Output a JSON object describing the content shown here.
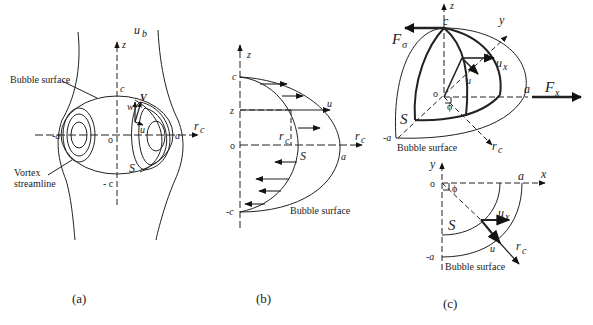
{
  "panels": {
    "a": {
      "caption": "(a)",
      "labels": {
        "u_b": "u",
        "u_b_sub": "b",
        "z": "z",
        "c": "c",
        "neg_c": "- c",
        "o": "o",
        "a_right": "a",
        "a_left": "-a",
        "r_c": "r",
        "r_c_sub": "c",
        "V": "V",
        "w": "w",
        "u": "u",
        "S": "S",
        "bubble_surface": "Bubble surface",
        "vortex_line1": "Vortex",
        "vortex_line2": "streamline"
      }
    },
    "b": {
      "caption": "(b)",
      "labels": {
        "z_axis": "z",
        "c": "c",
        "z": "z",
        "o": "o",
        "neg_c": "-c",
        "u": "u",
        "r_c": "r",
        "r_c_sub": "c",
        "r_c_axis": "r",
        "r_c_axis_sub": "c",
        "S": "S",
        "a": "a",
        "bubble_surface": "Bubble surface"
      }
    },
    "c": {
      "caption": "(c)",
      "labels": {
        "z": "z",
        "c": "c",
        "y": "y",
        "F_sigma": "F",
        "F_sigma_sub": "σ",
        "u_x": "u",
        "u_x_sub": "x",
        "u": "u",
        "o": "o",
        "phi": "ϕ",
        "a": "a",
        "F_x": "F",
        "F_x_sub": "x",
        "S": "S",
        "neg_a": "-a",
        "r_c": "r",
        "r_c_sub": "c",
        "bubble_surface": "Bubble surface"
      },
      "inset": {
        "y": "y",
        "o": "o",
        "phi": "ϕ",
        "a": "a",
        "x": "x",
        "S": "S",
        "u_x": "u",
        "u_x_sub": "x",
        "u": "u",
        "r_c": "r",
        "r_c_sub": "c",
        "neg_a": "-a",
        "bubble_surface": "Bubble surface"
      }
    }
  }
}
